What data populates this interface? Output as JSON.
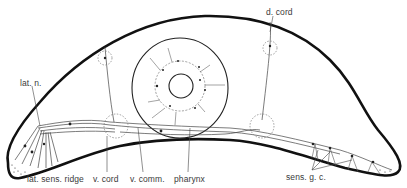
{
  "figure": {
    "labels": {
      "lat_n": "lat. n.",
      "d_cord": "d. cord",
      "lat_sens_ridge": "lat. sens. ridge",
      "v_cord": "v. cord",
      "v_comm": "v. comm.",
      "pharynx": "pharynx",
      "sens_g_c": "sens. g. c."
    },
    "colors": {
      "outline": "#111111",
      "nerve": "#444444",
      "dashed": "#777777",
      "label": "#3a3a3a",
      "background": "#ffffff"
    }
  }
}
